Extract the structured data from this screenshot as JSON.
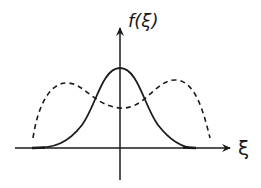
{
  "diagram": {
    "y_axis_label": "f(ξ)",
    "x_axis_label": "ξ",
    "stroke_color": "#1a1a1a",
    "background": "#ffffff",
    "curves": [
      {
        "name": "single-peak-solid",
        "style": "solid",
        "shape": "bell (Gaussian-like) centered on vertical axis"
      },
      {
        "name": "double-peak-dashed",
        "style": "dashed",
        "shape": "bimodal, two symmetric humps with dip at center"
      }
    ]
  }
}
